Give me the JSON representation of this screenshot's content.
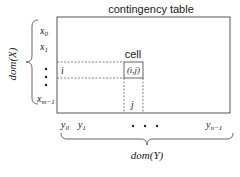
{
  "title": "contingency table",
  "cell": {
    "label": "cell",
    "coords": "(i,j)"
  },
  "row_marker": "i",
  "col_marker": "j",
  "rows": {
    "labels": [
      {
        "base": "x",
        "sub": "0"
      },
      {
        "base": "x",
        "sub": "1"
      },
      {
        "base": "x",
        "sub": "m−1"
      }
    ],
    "domain_label": "dom(X)"
  },
  "columns": {
    "labels": [
      {
        "base": "y",
        "sub": "0"
      },
      {
        "base": "y",
        "sub": "1"
      },
      {
        "base": "y",
        "sub": "n−1"
      }
    ],
    "domain_label": "dom(Y)"
  },
  "colors": {
    "line": "#555555",
    "dash": "#666666",
    "text": "#222222"
  }
}
